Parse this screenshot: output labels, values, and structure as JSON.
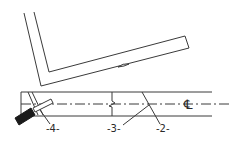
{
  "diagram": {
    "type": "technical-line-drawing",
    "colors": {
      "line": "#3a3a3a",
      "background": "#ffffff",
      "tool_handle": "#1a1a1a"
    },
    "parts": {
      "upper_piece": "angled L-shaped member",
      "lower_piece": "straight bar with centerline",
      "tool": "tool with dark handle"
    },
    "labels": {
      "part_2": "-2-",
      "part_3": "-3-",
      "part_4": "-4-",
      "centerline_symbol": "℄"
    }
  }
}
